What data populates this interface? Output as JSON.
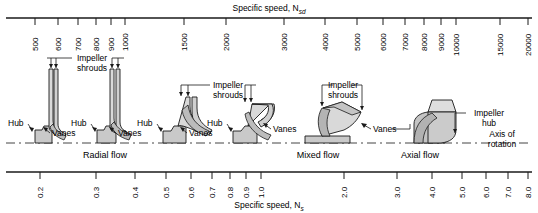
{
  "figure": {
    "top_axis": {
      "title": "Specific speed, N",
      "title_sub": "sd",
      "ticks": [
        500,
        600,
        700,
        800,
        900,
        1000,
        1500,
        2000,
        3000,
        4000,
        5000,
        6000,
        7000,
        8000,
        9000,
        10000,
        15000,
        20000
      ]
    },
    "bottom_axis": {
      "title": "Specific speed, N",
      "title_sub": "s",
      "ticks": [
        "0.2",
        "0.3",
        "0.4",
        "0.5",
        "0.6",
        "0.7",
        "0.8",
        "0.9",
        "1.0",
        "2.0",
        "3.0",
        "4.0",
        "5.0",
        "6.0",
        "7.0",
        "8.0"
      ]
    },
    "flow_regimes": [
      {
        "label": "Radial flow"
      },
      {
        "label": "Mixed flow"
      },
      {
        "label": "Axial flow"
      }
    ],
    "callouts": {
      "impeller_shrouds_1": "Impeller",
      "impeller_shrouds_1b": "shrouds",
      "impeller_shrouds_2": "Impeller",
      "impeller_shrouds_2b": "shrouds",
      "impeller_shrouds_3": "Impeller",
      "impeller_shrouds_3b": "shrouds",
      "impeller_hub": "Impeller",
      "impeller_hub_b": "hub",
      "axis_of_rotation": "Axis of",
      "axis_of_rotation_b": "rotation",
      "hub_1": "Hub",
      "hub_2": "Hub",
      "hub_3": "Hub",
      "hub_4": "Hub",
      "vanes_1": "Vanes",
      "vanes_2": "Vanes",
      "vanes_3": "Vanes",
      "vanes_4": "Vanes",
      "vanes_5": "Vanes"
    },
    "colors": {
      "line": "#1a1a1a",
      "fill_light": "#e2e2e2",
      "fill_mid": "#c9c9c9",
      "fill_dark": "#b0b0b0"
    }
  }
}
